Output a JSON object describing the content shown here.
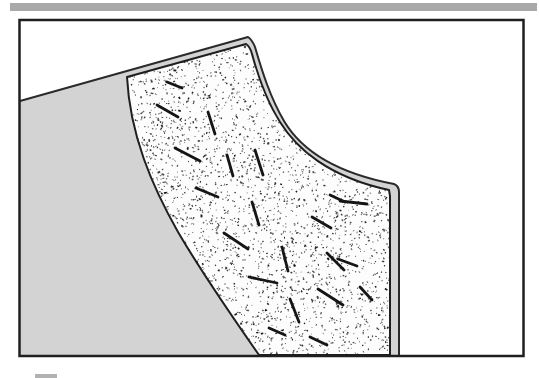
{
  "figure": {
    "description_name": "slope-deposit-cross-section-diagram",
    "canvas": {
      "width": 539,
      "height": 378,
      "background": "#ffffff"
    },
    "top_rule": {
      "x": 10,
      "y": 3,
      "width": 527,
      "height": 8,
      "color": "#a9a9a9"
    },
    "frame": {
      "x": 19.5,
      "y": 20,
      "width": 504,
      "height": 336,
      "stroke": "#1f1f1f",
      "stroke_width": 2.5,
      "fill": "#ffffff"
    },
    "slope_region": {
      "fill": "#d3d3d3",
      "outline_color": "#2a2a2a",
      "outline_width": 2,
      "fill_path": "M 20 101 L 248 37 C 251 39 253 42 255 47 C 262 71 270 97 284 121 C 300 148 331 172 394 184 Q 399 186 399 192 L 399 356 L 20 356 Z",
      "outline_path": "M 20 101 L 248 37 C 251 39 253 42 255 47 C 262 71 270 97 284 121 C 300 148 331 172 394 184 Q 399 186 399 192 L 399 356"
    },
    "deposit_region": {
      "fill": "#fdfdfd",
      "outline_color": "#1f1f1f",
      "outline_width": 2,
      "path": "M 127 77 L 246 44 C 249 46 251 50 252 54 C 258 76 266 100 280 122 C 296 148 328 177 389 190 L 390 196 L 390 355 L 259 355 C 236 322 205 278 178 232 C 152 186 130 135 127 77 Z"
    },
    "stipple": {
      "color": "#181818",
      "seed": 7,
      "count": 4200,
      "bbox": {
        "x0": 118,
        "y0": 30,
        "x1": 396,
        "y1": 356
      }
    },
    "clasts": {
      "color": "#151515",
      "stroke_width": 2.8,
      "segments": [
        [
          157,
          105,
          178,
          117
        ],
        [
          167,
          82,
          182,
          88
        ],
        [
          208,
          112,
          215,
          134
        ],
        [
          255,
          150,
          263,
          175
        ],
        [
          175,
          148,
          200,
          161
        ],
        [
          227,
          155,
          233,
          176
        ],
        [
          196,
          188,
          218,
          197
        ],
        [
          252,
          202,
          259,
          225
        ],
        [
          224,
          233,
          248,
          249
        ],
        [
          340,
          201,
          367,
          204
        ],
        [
          312,
          217,
          331,
          228
        ],
        [
          282,
          247,
          288,
          271
        ],
        [
          327,
          253,
          344,
          270
        ],
        [
          249,
          277,
          277,
          283
        ],
        [
          330,
          195,
          345,
          202
        ],
        [
          338,
          259,
          357,
          266
        ],
        [
          290,
          299,
          299,
          322
        ],
        [
          318,
          289,
          343,
          305
        ],
        [
          269,
          328,
          285,
          335
        ],
        [
          310,
          337,
          327,
          345
        ],
        [
          360,
          287,
          372,
          300
        ]
      ]
    },
    "legend_stub": {
      "x": 35,
      "y": 374,
      "width": 22,
      "height": 4,
      "color": "#b2b2b2"
    }
  }
}
